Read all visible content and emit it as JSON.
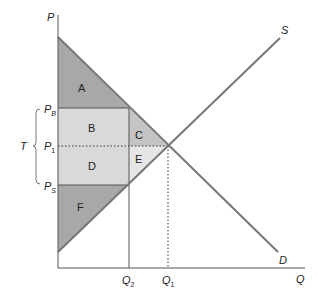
{
  "diagram": {
    "type": "supply-demand-tax-incidence",
    "axes": {
      "y_label": "P",
      "x_label": "Q"
    },
    "curves": {
      "supply_label": "S",
      "demand_label": "D"
    },
    "price_labels": {
      "buyer_price": {
        "main": "P",
        "sub": "B"
      },
      "equilibrium_price": {
        "main": "P",
        "sub": "1"
      },
      "seller_price": {
        "main": "P",
        "sub": "S"
      }
    },
    "quantity_labels": {
      "q2": {
        "main": "Q",
        "sub": "2"
      },
      "q1": {
        "main": "Q",
        "sub": "1"
      }
    },
    "tax_label": "T",
    "regions": {
      "A": "A",
      "B": "B",
      "C": "C",
      "D": "D",
      "E": "E",
      "F": "F"
    },
    "colors": {
      "dark_region": "#a8a8a8",
      "light_region": "#d9d9d9",
      "lighter_region": "#e6e6e6",
      "curve": "#777777",
      "axis": "#555555"
    }
  }
}
